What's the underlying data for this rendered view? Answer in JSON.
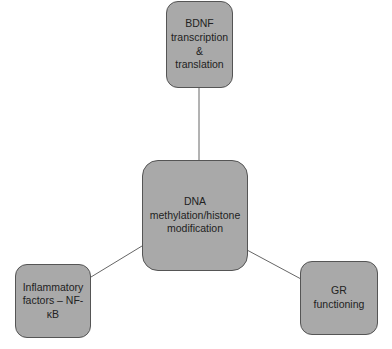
{
  "diagram": {
    "type": "hub-and-spoke",
    "colors": {
      "node_fill": "#a9a9a9",
      "node_border": "#555555",
      "connector": "#666666",
      "text": "#222222",
      "background": "#ffffff"
    },
    "nodes": {
      "center": {
        "label": "DNA\nmethylation/histone\nmodification"
      },
      "top": {
        "label": "BDNF\ntranscription\n&\ntranslation"
      },
      "left": {
        "label": "Inflammatory\nfactors – NF-κB"
      },
      "right": {
        "label": "GR\nfunctioning"
      }
    },
    "edges": [
      {
        "from": "center",
        "to": "top"
      },
      {
        "from": "center",
        "to": "left"
      },
      {
        "from": "center",
        "to": "right"
      }
    ]
  }
}
